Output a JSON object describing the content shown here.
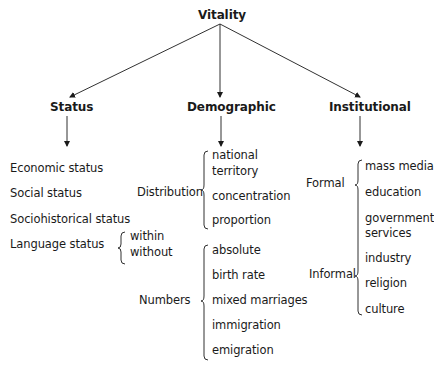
{
  "root": "Vitality",
  "categories": {
    "status": {
      "label": "Status",
      "items": [
        "Economic status",
        "Social status",
        "Sociohistorical status",
        "Language status"
      ],
      "language_sub": [
        "within",
        "without"
      ]
    },
    "demographic": {
      "label": "Demographic",
      "distribution": {
        "label": "Distribution",
        "items": [
          "national",
          "territory",
          "concentration",
          "proportion"
        ]
      },
      "numbers": {
        "label": "Numbers",
        "items": [
          "absolute",
          "birth rate",
          "mixed marriages",
          "immigration",
          "emigration"
        ]
      }
    },
    "institutional": {
      "label": "Institutional",
      "formal": {
        "label": "Formal",
        "items": [
          "mass media",
          "education",
          "government",
          "services"
        ]
      },
      "informal": {
        "label": "Informal",
        "items": [
          "industry",
          "religion",
          "culture"
        ]
      }
    }
  },
  "colors": {
    "ink": "#1a1a1a"
  }
}
